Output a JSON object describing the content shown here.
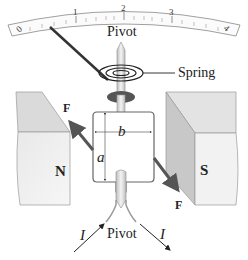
{
  "diagram": {
    "type": "galvanometer",
    "scale": {
      "ticks": [
        "0",
        "1",
        "2",
        "3",
        "4"
      ]
    },
    "labels": {
      "top_pivot": "Pivot",
      "bottom_pivot": "Pivot",
      "spring": "Spring",
      "north_pole": "N",
      "south_pole": "S",
      "coil_width": "b",
      "coil_height": "a",
      "force_left": "F⃗",
      "force_right": "F⃗",
      "current_in": "I",
      "current_out": "I"
    },
    "colors": {
      "magnet_face": "#e6e6e6",
      "magnet_side": "#cfcfcf",
      "magnet_top": "#dcdcdc",
      "force_arrow": "#555555",
      "pointer": "#333333",
      "spring_base": "#555555",
      "coil_outline": "#666666"
    }
  }
}
